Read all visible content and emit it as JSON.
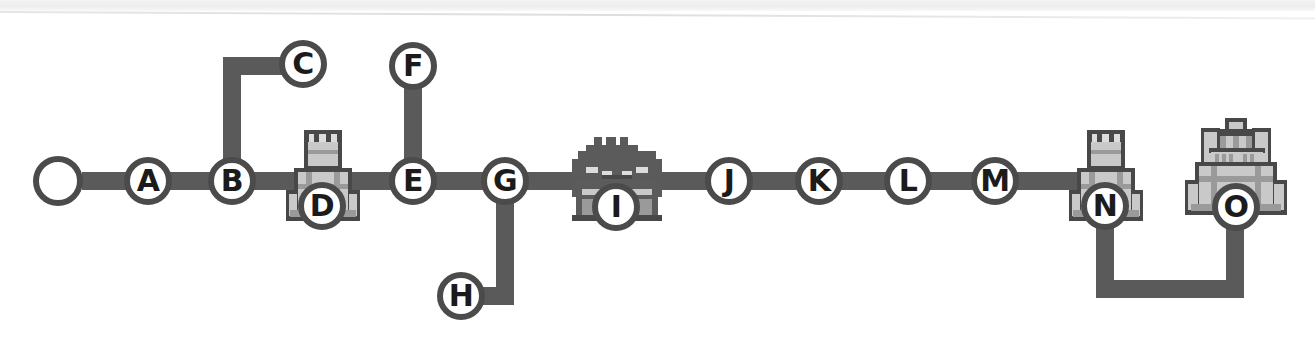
{
  "map": {
    "title": "World Map Level Progression",
    "background_color": "#ffffff",
    "path_color": "#5a5a5a",
    "node_outline_color": "#4b4b4b",
    "node_fill_color": "#ffffff",
    "label_color": "#1b1b1b",
    "sprite_colors": {
      "dark": "#5b5b5b",
      "mid": "#9a9a9a",
      "light": "#c9c9c9",
      "pale": "#dcdcdc",
      "outline": "#484848"
    },
    "start_node": {
      "name": "start-node",
      "label": "",
      "type": "start",
      "x": 58,
      "y": 181
    },
    "nodes": [
      {
        "id": "A",
        "label": "A",
        "type": "level",
        "x": 148,
        "y": 181
      },
      {
        "id": "B",
        "label": "B",
        "type": "level",
        "x": 232,
        "y": 181
      },
      {
        "id": "C",
        "label": "C",
        "type": "level",
        "x": 303,
        "y": 64
      },
      {
        "id": "D",
        "label": "D",
        "type": "fortress",
        "x": 322,
        "y": 206
      },
      {
        "id": "E",
        "label": "E",
        "type": "level",
        "x": 413,
        "y": 181
      },
      {
        "id": "F",
        "label": "F",
        "type": "level",
        "x": 413,
        "y": 66
      },
      {
        "id": "G",
        "label": "G",
        "type": "level",
        "x": 505,
        "y": 181
      },
      {
        "id": "H",
        "label": "H",
        "type": "level",
        "x": 461,
        "y": 296
      },
      {
        "id": "I",
        "label": "I",
        "type": "ghost-house",
        "x": 616,
        "y": 207
      },
      {
        "id": "J",
        "label": "J",
        "type": "level",
        "x": 729,
        "y": 181
      },
      {
        "id": "K",
        "label": "K",
        "type": "level",
        "x": 819,
        "y": 181
      },
      {
        "id": "L",
        "label": "L",
        "type": "level",
        "x": 908,
        "y": 181
      },
      {
        "id": "M",
        "label": "M",
        "type": "level",
        "x": 995,
        "y": 181
      },
      {
        "id": "N",
        "label": "N",
        "type": "fortress",
        "x": 1105,
        "y": 206
      },
      {
        "id": "O",
        "label": "O",
        "type": "castle",
        "x": 1236,
        "y": 207
      }
    ],
    "edges": [
      {
        "from": "start",
        "to": "A",
        "kind": "horizontal"
      },
      {
        "from": "A",
        "to": "B",
        "kind": "horizontal"
      },
      {
        "from": "B",
        "to": "C",
        "kind": "up-then-right"
      },
      {
        "from": "B",
        "to": "D",
        "kind": "horizontal"
      },
      {
        "from": "D",
        "to": "E",
        "kind": "horizontal"
      },
      {
        "from": "F",
        "to": "E",
        "kind": "vertical"
      },
      {
        "from": "E",
        "to": "G",
        "kind": "horizontal"
      },
      {
        "from": "G",
        "to": "H",
        "kind": "down-then-left"
      },
      {
        "from": "G",
        "to": "I",
        "kind": "horizontal"
      },
      {
        "from": "I",
        "to": "J",
        "kind": "horizontal"
      },
      {
        "from": "J",
        "to": "K",
        "kind": "horizontal"
      },
      {
        "from": "K",
        "to": "L",
        "kind": "horizontal"
      },
      {
        "from": "L",
        "to": "M",
        "kind": "horizontal"
      },
      {
        "from": "M",
        "to": "N",
        "kind": "horizontal"
      },
      {
        "from": "N",
        "to": "O",
        "kind": "down-across-up"
      }
    ],
    "legend": {
      "start": "start-marker",
      "level": "level-node",
      "fortress": "fortress-sprite",
      "ghost_house": "ghost-house-sprite",
      "castle": "castle-sprite"
    }
  }
}
